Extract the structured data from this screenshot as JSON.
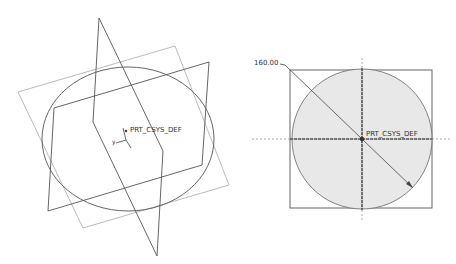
{
  "iso_view": {
    "csys_label": "PRT_CSYS_DEF",
    "axis_label_y": "y"
  },
  "top_view": {
    "dimension_label": "160.00",
    "csys_label": "PRT_CSYS_DEF",
    "fill_color": "#e8e8e8"
  },
  "colors": {
    "line": "#555555",
    "light_line": "#999999"
  }
}
